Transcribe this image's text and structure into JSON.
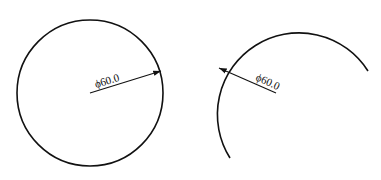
{
  "figures": [
    {
      "name": "full-circle",
      "type": "circle",
      "dimension_label": "ϕ60.0",
      "dimension_kind": "diameter"
    },
    {
      "name": "partial-arc",
      "type": "arc",
      "dimension_label": "ϕ60.0",
      "dimension_kind": "diameter"
    }
  ],
  "colors": {
    "stroke": "#111111",
    "background": "#ffffff"
  }
}
